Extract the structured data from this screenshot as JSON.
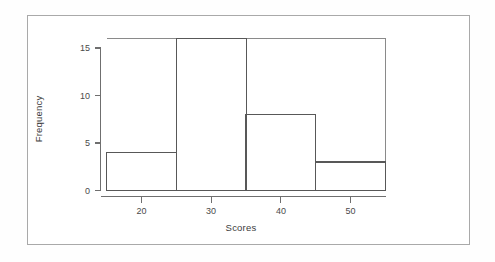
{
  "chart_data": {
    "type": "bar",
    "title": "",
    "subtitle": "",
    "xlabel": "Scores",
    "ylabel": "Frequency",
    "categories": [
      "15-25",
      "25-35",
      "35-45",
      "45-55"
    ],
    "bin_edges": [
      15,
      25,
      35,
      45,
      55
    ],
    "values": [
      4,
      16,
      8,
      3
    ],
    "bar_labels": [
      "4",
      "16",
      "8",
      "3"
    ],
    "xlim": [
      15,
      55
    ],
    "ylim": [
      0,
      16
    ],
    "xticks": [
      20,
      30,
      40,
      50
    ],
    "xtick_labels": [
      "20",
      "30",
      "40",
      "50"
    ],
    "yticks": [
      0,
      5,
      10,
      15
    ],
    "ytick_labels": [
      "0",
      "5",
      "10",
      "15"
    ],
    "grid": false,
    "legend": null,
    "legend_position": "none",
    "bar_fill": "#ffffff",
    "bar_stroke": "#585858",
    "axis_color": "#6f6f6f",
    "text_color": "#3c3c3c",
    "background": "#ffffff",
    "frame_color": "#a9a9a9"
  },
  "figure": {
    "alt": "Histogram of Scores versus Frequency"
  }
}
